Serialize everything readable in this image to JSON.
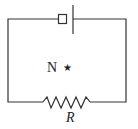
{
  "diagram": {
    "type": "circuit",
    "labels": {
      "point": "N",
      "marker": "★",
      "resistor": "R"
    },
    "components": [
      {
        "kind": "switch-or-box",
        "position": "top"
      },
      {
        "kind": "plate",
        "position": "top"
      },
      {
        "kind": "resistor",
        "label": "R",
        "position": "bottom"
      }
    ],
    "colors": {
      "stroke": "#333333",
      "background": "#ffffff"
    }
  }
}
